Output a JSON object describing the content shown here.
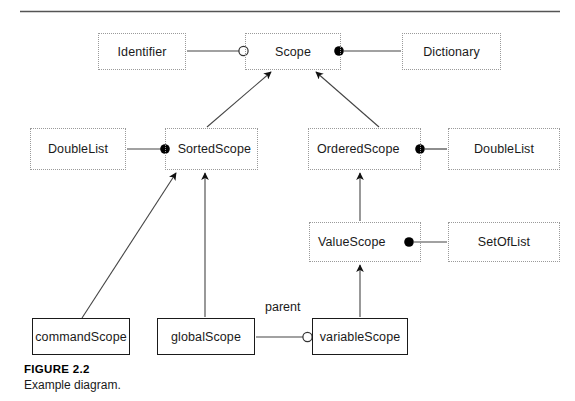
{
  "figure": {
    "title": "FIGURE 2.2",
    "caption": "Example diagram.",
    "rule_color": "#555555",
    "class_border_color": "#9a9a9a",
    "instance_border_color": "#1a1a1a",
    "line_color": "#444444",
    "marker_fill_color": "#000000",
    "marker_hollow_fill": "#ffffff"
  },
  "diagram": {
    "type": "class-diagram",
    "nodes": [
      {
        "id": "identifier",
        "label": "Identifier",
        "kind": "class",
        "x": 98,
        "y": 33,
        "w": 88,
        "h": 37
      },
      {
        "id": "scope",
        "label": "Scope",
        "kind": "class",
        "x": 245,
        "y": 33,
        "w": 96,
        "h": 37
      },
      {
        "id": "dictionary",
        "label": "Dictionary",
        "kind": "class",
        "x": 402,
        "y": 33,
        "w": 99,
        "h": 37
      },
      {
        "id": "doublelist-l",
        "label": "DoubleList",
        "kind": "class",
        "x": 30,
        "y": 128,
        "w": 96,
        "h": 42
      },
      {
        "id": "sortedscope",
        "label": "SortedScope",
        "kind": "class",
        "x": 165,
        "y": 128,
        "w": 93,
        "h": 42
      },
      {
        "id": "orderedscope",
        "label": "OrderedScope",
        "kind": "class",
        "x": 308,
        "y": 128,
        "w": 113,
        "h": 42
      },
      {
        "id": "doublelist-r",
        "label": "DoubleList",
        "kind": "class",
        "x": 448,
        "y": 128,
        "w": 112,
        "h": 42
      },
      {
        "id": "valuescope",
        "label": "ValueScope",
        "kind": "class",
        "x": 309,
        "y": 222,
        "w": 112,
        "h": 40
      },
      {
        "id": "setoflist",
        "label": "SetOfList",
        "kind": "class",
        "x": 448,
        "y": 222,
        "w": 112,
        "h": 40
      },
      {
        "id": "commandscope",
        "label": "commandScope",
        "kind": "instance",
        "x": 32,
        "y": 318,
        "w": 98,
        "h": 37
      },
      {
        "id": "globalscope",
        "label": "globalScope",
        "kind": "instance",
        "x": 157,
        "y": 318,
        "w": 98,
        "h": 37
      },
      {
        "id": "variablescope",
        "label": "variableScope",
        "kind": "instance",
        "x": 312,
        "y": 318,
        "w": 96,
        "h": 37
      }
    ],
    "edge_labels": [
      {
        "id": "parent",
        "label": "parent",
        "x": 265,
        "y": 300
      }
    ],
    "associations": [
      {
        "from": "identifier",
        "to": "scope",
        "marker": "hollow-circle"
      },
      {
        "from": "scope",
        "to": "dictionary",
        "marker": "filled-circle"
      },
      {
        "from": "doublelist-l",
        "to": "sortedscope",
        "marker": "filled-circle"
      },
      {
        "from": "orderedscope",
        "to": "doublelist-r",
        "marker": "filled-circle"
      },
      {
        "from": "valuescope",
        "to": "setoflist",
        "marker": "filled-circle"
      },
      {
        "from": "globalscope",
        "to": "variablescope",
        "marker": "hollow-circle",
        "label": "parent"
      }
    ],
    "generalizations": [
      {
        "from": "sortedscope",
        "to": "scope"
      },
      {
        "from": "orderedscope",
        "to": "scope"
      },
      {
        "from": "commandscope",
        "to": "sortedscope"
      },
      {
        "from": "globalscope",
        "to": "sortedscope"
      },
      {
        "from": "valuescope",
        "to": "orderedscope"
      },
      {
        "from": "variablescope",
        "to": "valuescope"
      }
    ]
  }
}
